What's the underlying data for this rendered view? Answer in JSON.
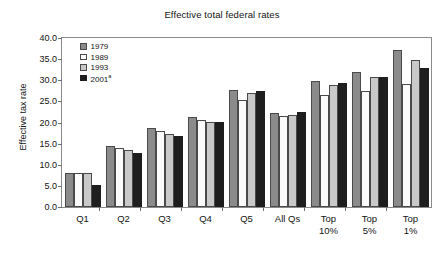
{
  "chart_data": {
    "type": "bar",
    "title": "Effective total federal rates",
    "xlabel": "",
    "ylabel": "Effective tax rate",
    "ylim": [
      0.0,
      40.0
    ],
    "ytick_step": 5.0,
    "grid": false,
    "legend_position": "top-left inside plot",
    "categories": [
      "Q1",
      "Q2",
      "Q3",
      "Q4",
      "Q5",
      "All Qs",
      "Top\n10%",
      "Top\n5%",
      "Top\n1%"
    ],
    "ytick_labels": [
      "40.0",
      "35.0",
      "30.0",
      "25.0",
      "20.0",
      "15.0",
      "10.0",
      "5.0",
      "0.0"
    ],
    "ytick_values": [
      40.0,
      35.0,
      30.0,
      25.0,
      20.0,
      15.0,
      10.0,
      5.0,
      0.0
    ],
    "series": [
      {
        "name": "1979",
        "color": "#8b8b8b",
        "values": [
          8.0,
          14.4,
          18.7,
          21.3,
          27.7,
          22.3,
          29.8,
          31.9,
          37.1
        ]
      },
      {
        "name": "1989",
        "color": "#fbfbfb",
        "values": [
          8.0,
          14.0,
          18.0,
          20.6,
          25.3,
          21.6,
          26.5,
          27.4,
          29.1
        ]
      },
      {
        "name": "1993",
        "color": "#c9c9c9",
        "values": [
          8.0,
          13.6,
          17.4,
          20.2,
          27.0,
          21.8,
          28.8,
          30.7,
          34.7
        ]
      },
      {
        "name": "2001",
        "name_sup": "a",
        "color": "#1e1e1e",
        "values": [
          5.3,
          12.8,
          16.8,
          20.1,
          27.5,
          22.4,
          29.3,
          30.7,
          32.9
        ]
      }
    ]
  }
}
